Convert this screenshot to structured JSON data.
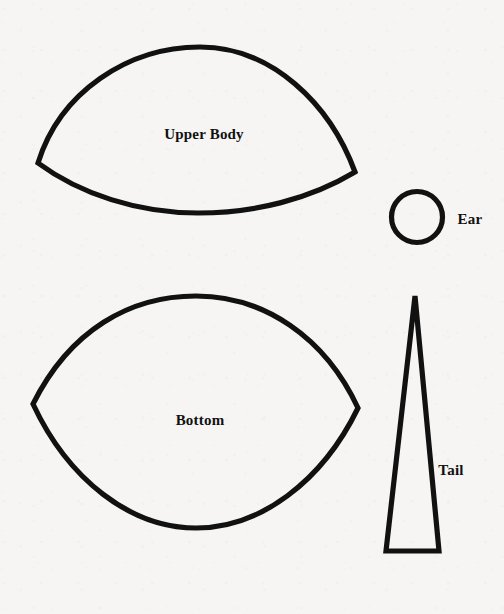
{
  "document": {
    "title": "Sewing Pattern Template Sheet",
    "background_color": "#f6f5f3",
    "ink_color": "#111111",
    "width": 504,
    "height": 614
  },
  "pieces": [
    {
      "id": "upper-body",
      "label": "Upper Body",
      "shape": "dome-lens",
      "label_x": 204,
      "label_y": 134
    },
    {
      "id": "ear",
      "label": "Ear",
      "shape": "circle",
      "label_x": 455,
      "label_y": 219
    },
    {
      "id": "bottom",
      "label": "Bottom",
      "shape": "lens",
      "label_x": 200,
      "label_y": 420
    },
    {
      "id": "tail",
      "label": "Tail",
      "shape": "narrow-triangle",
      "label_x": 434,
      "label_y": 470
    }
  ]
}
